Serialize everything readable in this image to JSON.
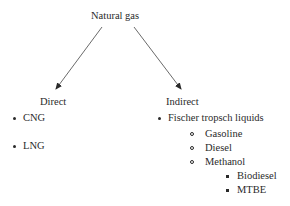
{
  "diagram": {
    "root": "Natural gas",
    "branches": [
      {
        "label": "Direct",
        "items": [
          "CNG",
          "LNG"
        ]
      },
      {
        "label": "Indirect",
        "items": [
          {
            "label": "Fischer tropsch liquids",
            "children": [
              {
                "label": "Gasoline"
              },
              {
                "label": "Diesel"
              },
              {
                "label": "Methanol",
                "children": [
                  "Biodiesel",
                  "MTBE"
                ]
              }
            ]
          }
        ]
      }
    ]
  }
}
